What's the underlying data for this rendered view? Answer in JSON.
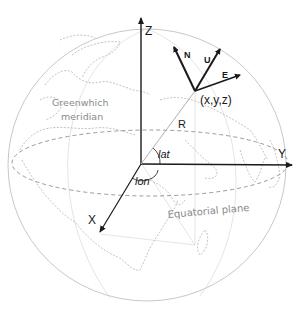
{
  "diagram": {
    "axes": {
      "z_label": "Z",
      "y_label": "Y",
      "x_label": "X"
    },
    "point_label": "(x,y,z)",
    "local_frame": {
      "north_label": "N",
      "up_label": "U",
      "east_label": "E"
    },
    "radius_label": "R",
    "latitude_label": "lat",
    "longitude_label": "lon",
    "meridian_label_line1": "Greenwhich",
    "meridian_label_line2": "meridian",
    "equator_label": "Equatorial plane",
    "colors": {
      "axis": "#1a1a1a",
      "annotation_gray": "#8a8a8a",
      "globe_outline": "#c8c8c8",
      "equator_dash": "#9a9a9a"
    }
  }
}
